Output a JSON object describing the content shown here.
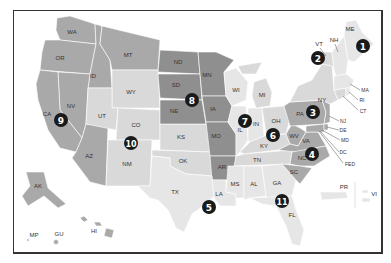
{
  "map": {
    "title": "",
    "colors": {
      "dark": "#8f8f8f",
      "mid": "#a9a9a9",
      "light": "#d9d9d9",
      "pale": "#e6e6e6",
      "badge": "#1a1a1a",
      "border": "#333333"
    },
    "circuits": [
      {
        "number": "1",
        "x": 364,
        "y": 46
      },
      {
        "number": "2",
        "x": 318,
        "y": 58
      },
      {
        "number": "3",
        "x": 313,
        "y": 90
      },
      {
        "number": "4",
        "x": 312,
        "y": 153
      },
      {
        "number": "5",
        "x": 209,
        "y": 207
      },
      {
        "number": "6",
        "x": 272,
        "y": 135
      },
      {
        "number": "7",
        "x": 245,
        "y": 121
      },
      {
        "number": "8",
        "x": 192,
        "y": 100
      },
      {
        "number": "9",
        "x": 61,
        "y": 120
      },
      {
        "number": "10",
        "x": 131,
        "y": 143
      },
      {
        "number": "11",
        "x": 282,
        "y": 201
      }
    ],
    "state_labels": [
      {
        "text": "WA",
        "x": 72,
        "y": 34
      },
      {
        "text": "OR",
        "x": 60,
        "y": 60
      },
      {
        "text": "ID",
        "x": 93,
        "y": 78
      },
      {
        "text": "MT",
        "x": 128,
        "y": 57
      },
      {
        "text": "WY",
        "x": 131,
        "y": 94
      },
      {
        "text": "NV",
        "x": 71,
        "y": 108
      },
      {
        "text": "CA",
        "x": 47,
        "y": 116
      },
      {
        "text": "UT",
        "x": 102,
        "y": 118
      },
      {
        "text": "CO",
        "x": 136,
        "y": 127
      },
      {
        "text": "AZ",
        "x": 89,
        "y": 158
      },
      {
        "text": "NM",
        "x": 127,
        "y": 166
      },
      {
        "text": "ND",
        "x": 178,
        "y": 64
      },
      {
        "text": "SD",
        "x": 176,
        "y": 87
      },
      {
        "text": "NE",
        "x": 174,
        "y": 113
      },
      {
        "text": "KS",
        "x": 181,
        "y": 139
      },
      {
        "text": "MN",
        "x": 207,
        "y": 77
      },
      {
        "text": "IA",
        "x": 213,
        "y": 111
      },
      {
        "text": "MO",
        "x": 216,
        "y": 138
      },
      {
        "text": "OK",
        "x": 183,
        "y": 163
      },
      {
        "text": "TX",
        "x": 175,
        "y": 194
      },
      {
        "text": "AR",
        "x": 215,
        "y": 169
      },
      {
        "text": "LA",
        "x": 216,
        "y": 196
      },
      {
        "text": "MS",
        "x": 235,
        "y": 186
      },
      {
        "text": "AL",
        "x": 252,
        "y": 186
      },
      {
        "text": "GA",
        "x": 277,
        "y": 185
      },
      {
        "text": "FL",
        "x": 292,
        "y": 217
      },
      {
        "text": "SC",
        "x": 294,
        "y": 170
      },
      {
        "text": "NC",
        "x": 300,
        "y": 159
      },
      {
        "text": "TN",
        "x": 257,
        "y": 164
      },
      {
        "text": "KY",
        "x": 264,
        "y": 146
      },
      {
        "text": "VA",
        "x": 304,
        "y": 145
      },
      {
        "text": "WV",
        "x": 293,
        "y": 140
      },
      {
        "text": "OH",
        "x": 279,
        "y": 123
      },
      {
        "text": "IN",
        "x": 258,
        "y": 127
      },
      {
        "text": "IL",
        "x": 240,
        "y": 130
      },
      {
        "text": "WI",
        "x": 234,
        "y": 92
      },
      {
        "text": "MI",
        "x": 262,
        "y": 97
      },
      {
        "text": "PA",
        "x": 300,
        "y": 116
      },
      {
        "text": "NY",
        "x": 322,
        "y": 103
      },
      {
        "text": "VT",
        "x": 319,
        "y": 43
      },
      {
        "text": "NH",
        "x": 334,
        "y": 40
      },
      {
        "text": "ME",
        "x": 350,
        "y": 31
      },
      {
        "text": "AK",
        "x": 38,
        "y": 188
      },
      {
        "text": "HI",
        "x": 94,
        "y": 233
      },
      {
        "text": "MP",
        "x": 34,
        "y": 237
      },
      {
        "text": "GU",
        "x": 59,
        "y": 236
      },
      {
        "text": "PR",
        "x": 342,
        "y": 190
      },
      {
        "text": "VI",
        "x": 374,
        "y": 196
      }
    ],
    "callouts": [
      {
        "text": "MA",
        "x": 364,
        "y": 91
      },
      {
        "text": "RI",
        "x": 361,
        "y": 101
      },
      {
        "text": "CT",
        "x": 362,
        "y": 112
      },
      {
        "text": "NJ",
        "x": 343,
        "y": 122
      },
      {
        "text": "DE",
        "x": 343,
        "y": 131
      },
      {
        "text": "MD",
        "x": 345,
        "y": 141
      },
      {
        "text": "DC",
        "x": 343,
        "y": 153
      },
      {
        "text": "FED",
        "x": 350,
        "y": 165
      }
    ]
  }
}
